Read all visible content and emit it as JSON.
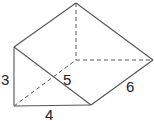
{
  "diagram": {
    "type": "triangular-prism",
    "vertices": {
      "A": [
        14,
        47
      ],
      "B": [
        14,
        106
      ],
      "C": [
        91,
        105
      ],
      "D": [
        76,
        3
      ],
      "E": [
        76,
        60
      ],
      "F": [
        153,
        60
      ]
    },
    "solid_edges": [
      [
        "A",
        "B"
      ],
      [
        "B",
        "C"
      ],
      [
        "A",
        "C"
      ],
      [
        "A",
        "D"
      ],
      [
        "D",
        "F"
      ],
      [
        "C",
        "F"
      ]
    ],
    "dashed_edges": [
      [
        "D",
        "E"
      ],
      [
        "E",
        "F"
      ],
      [
        "B",
        "E"
      ]
    ],
    "labels": [
      {
        "text": "3",
        "x": 1,
        "y": 85,
        "edge": "height"
      },
      {
        "text": "4",
        "x": 45,
        "y": 120,
        "edge": "base"
      },
      {
        "text": "5",
        "x": 63,
        "y": 85,
        "edge": "hypotenuse"
      },
      {
        "text": "6",
        "x": 126,
        "y": 92,
        "edge": "length"
      }
    ],
    "stroke_color": "#555555"
  }
}
